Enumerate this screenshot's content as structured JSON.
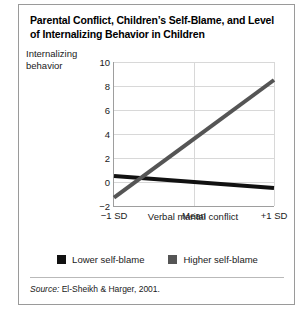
{
  "figure": {
    "title": "Parental Conflict, Children’s Self-Blame, and Level of Internalizing Behavior in Children",
    "source_keyword": "Source:",
    "source_text": " El-Sheikh & Harger, 2001."
  },
  "colors": {
    "lower_self_blame": "#111111",
    "higher_self_blame": "#555555",
    "axis": "#9e9e9e",
    "gridline": "#d8d8d8",
    "border": "#9a9a9a",
    "text": "#1a1a1a"
  },
  "legend": {
    "entries": [
      {
        "label": "Lower self-blame",
        "color": "#111111"
      },
      {
        "label": "Higher self-blame",
        "color": "#555555"
      }
    ]
  },
  "chart_data": {
    "type": "line",
    "title": "Parental Conflict, Children’s Self-Blame, and Level of Internalizing Behavior in Children",
    "xlabel": "Verbal marital conflict",
    "ylabel": "Internalizing behavior",
    "categories": [
      "−1 SD",
      "Mean",
      "+1 SD"
    ],
    "yticks": [
      -2,
      0,
      2,
      4,
      6,
      8,
      10
    ],
    "ytick_labels": [
      "−2",
      "0",
      "2",
      "4",
      "6",
      "8",
      "10"
    ],
    "ylim": [
      -2,
      10
    ],
    "grid": "horizontal-and-vertical",
    "legend_position": "bottom-center",
    "series": [
      {
        "name": "Lower self-blame",
        "color": "#111111",
        "values": [
          0.5,
          0.0,
          -0.5
        ]
      },
      {
        "name": "Higher self-blame",
        "color": "#555555",
        "values": [
          -1.3,
          3.6,
          8.5
        ]
      }
    ]
  }
}
